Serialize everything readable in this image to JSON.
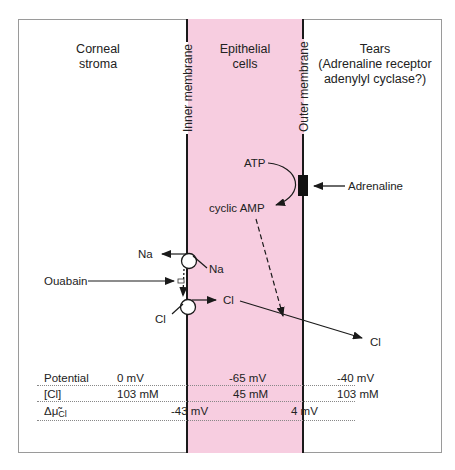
{
  "figure": {
    "colors": {
      "cell_band": "#f7cde0",
      "membrane": "#1a1a1a",
      "frame": "#9a9a9a",
      "text": "#222222",
      "dotted_rule": "#888888"
    },
    "regions": {
      "left": {
        "line1": "Corneal",
        "line2": "stroma"
      },
      "middle": {
        "line1": "Epithelial",
        "line2": "cells"
      },
      "right": {
        "line1": "Tears",
        "line2": "(Adrenaline receptor",
        "line3": "adenylyl cyclase?)"
      }
    },
    "membranes": {
      "inner": "Inner membrane",
      "outer": "Outer membrane"
    },
    "signaling": {
      "atp": "ATP",
      "camp": "cyclic AMP",
      "adrenaline": "Adrenaline"
    },
    "transport": {
      "na_out": "Na",
      "na_in": "Na",
      "ouabain": "Ouabain",
      "cl_in": "Cl",
      "cl_mid": "Cl",
      "cl_tears": "Cl"
    },
    "table": {
      "rows": [
        {
          "label": "Potential",
          "stroma": "0 mV",
          "cell": "-65 mV",
          "tears": "-40 mV"
        },
        {
          "label": "[Cl]",
          "stroma": "103 mM",
          "cell": "45 mM",
          "tears": "103 mM"
        }
      ],
      "delta_row": {
        "label_symbol": "Δμ̃",
        "label_sub": "Cl",
        "inner": "-43 mV",
        "outer": "4 mV"
      }
    }
  }
}
